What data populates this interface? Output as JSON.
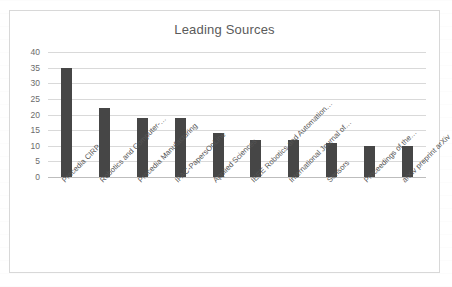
{
  "chart_data": {
    "type": "bar",
    "title": "Leading Sources",
    "xlabel": "",
    "ylabel": "",
    "ylim": [
      0,
      40
    ],
    "ytick_values": [
      0,
      5,
      10,
      15,
      20,
      25,
      30,
      35,
      40
    ],
    "ytick_labels": [
      "0",
      "5",
      "10",
      "15",
      "20",
      "25",
      "30",
      "35",
      "40"
    ],
    "grid": true,
    "legend": false,
    "bar_color": "#464646",
    "categories": [
      "Procedia CIRP",
      "Robotics and Computer-…",
      "Procedia Manufacturing",
      "IFAC-PapersOnLine",
      "Applied Sciences",
      "IEEE Robotics and Automation…",
      "International Journal of…",
      "Sensors",
      "Proceedings of the…",
      "arXiv preprint arXiv"
    ],
    "values": [
      35,
      22,
      19,
      19,
      14,
      12,
      12,
      11,
      10,
      10
    ]
  },
  "frame": {
    "border_color": "#d8d8d8",
    "background": "#ffffff"
  }
}
